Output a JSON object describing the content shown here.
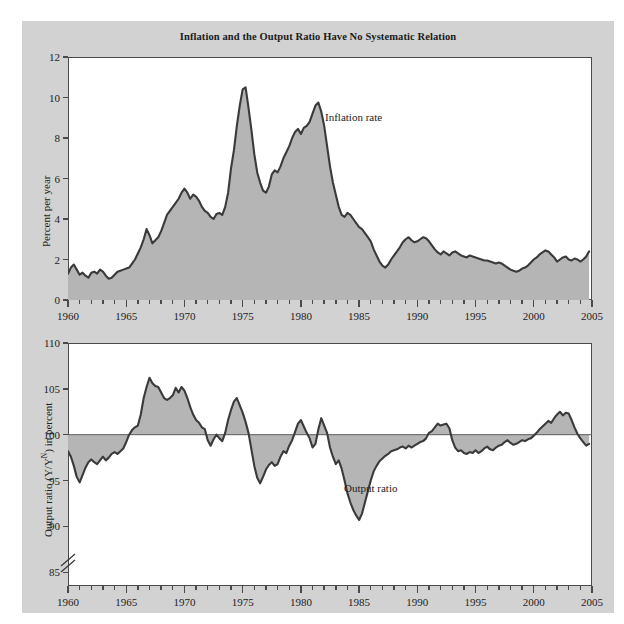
{
  "figure": {
    "title": "Inflation and the Output Ratio Have No Systematic Relation",
    "background_color": "#d2d2d2",
    "plot_background_color": "#ffffff",
    "fill_color": "#b5b5b5",
    "line_color": "#3a3a3a"
  },
  "chart_data": [
    {
      "type": "area",
      "id": "inflation-panel",
      "title": "Inflation and the Output Ratio Have No Systematic Relation",
      "xlabel": "",
      "ylabel": "Percent per year",
      "series_label": "Inflation rate",
      "xlim": [
        1960,
        2005
      ],
      "ylim": [
        0,
        12
      ],
      "xticks": [
        1960,
        1965,
        1970,
        1975,
        1980,
        1985,
        1990,
        1995,
        2000,
        2005
      ],
      "yticks": [
        0,
        2,
        4,
        6,
        8,
        10,
        12
      ],
      "minor_x_step": 1,
      "grid": false,
      "legend_position": "inline-annotation",
      "baseline": 0,
      "x": [
        1960.0,
        1960.25,
        1960.5,
        1960.75,
        1961.0,
        1961.25,
        1961.5,
        1961.75,
        1962.0,
        1962.25,
        1962.5,
        1962.75,
        1963.0,
        1963.25,
        1963.5,
        1963.75,
        1964.0,
        1964.25,
        1964.5,
        1964.75,
        1965.0,
        1965.25,
        1965.5,
        1965.75,
        1966.0,
        1966.25,
        1966.5,
        1966.75,
        1967.0,
        1967.25,
        1967.5,
        1967.75,
        1968.0,
        1968.25,
        1968.5,
        1968.75,
        1969.0,
        1969.25,
        1969.5,
        1969.75,
        1970.0,
        1970.25,
        1970.5,
        1970.75,
        1971.0,
        1971.25,
        1971.5,
        1971.75,
        1972.0,
        1972.25,
        1972.5,
        1972.75,
        1973.0,
        1973.25,
        1973.5,
        1973.75,
        1974.0,
        1974.25,
        1974.5,
        1974.75,
        1975.0,
        1975.25,
        1975.5,
        1975.75,
        1976.0,
        1976.25,
        1976.5,
        1976.75,
        1977.0,
        1977.25,
        1977.5,
        1977.75,
        1978.0,
        1978.25,
        1978.5,
        1978.75,
        1979.0,
        1979.25,
        1979.5,
        1979.75,
        1980.0,
        1980.25,
        1980.5,
        1980.75,
        1981.0,
        1981.25,
        1981.5,
        1981.75,
        1982.0,
        1982.25,
        1982.5,
        1982.75,
        1983.0,
        1983.25,
        1983.5,
        1983.75,
        1984.0,
        1984.25,
        1984.5,
        1984.75,
        1985.0,
        1985.25,
        1985.5,
        1985.75,
        1986.0,
        1986.25,
        1986.5,
        1986.75,
        1987.0,
        1987.25,
        1987.5,
        1987.75,
        1988.0,
        1988.25,
        1988.5,
        1988.75,
        1989.0,
        1989.25,
        1989.5,
        1989.75,
        1990.0,
        1990.25,
        1990.5,
        1990.75,
        1991.0,
        1991.25,
        1991.5,
        1991.75,
        1992.0,
        1992.25,
        1992.5,
        1992.75,
        1993.0,
        1993.25,
        1993.5,
        1993.75,
        1994.0,
        1994.25,
        1994.5,
        1994.75,
        1995.0,
        1995.25,
        1995.5,
        1995.75,
        1996.0,
        1996.25,
        1996.5,
        1996.75,
        1997.0,
        1997.25,
        1997.5,
        1997.75,
        1998.0,
        1998.25,
        1998.5,
        1998.75,
        1999.0,
        1999.25,
        1999.5,
        1999.75,
        2000.0,
        2000.25,
        2000.5,
        2000.75,
        2001.0,
        2001.25,
        2001.5,
        2001.75,
        2002.0,
        2002.25,
        2002.5,
        2002.75,
        2003.0,
        2003.25,
        2003.5,
        2003.75,
        2004.0,
        2004.25,
        2004.5,
        2004.75
      ],
      "values": [
        1.3,
        1.6,
        1.75,
        1.5,
        1.25,
        1.35,
        1.2,
        1.1,
        1.35,
        1.4,
        1.3,
        1.5,
        1.4,
        1.2,
        1.05,
        1.1,
        1.25,
        1.4,
        1.45,
        1.5,
        1.55,
        1.6,
        1.8,
        2.0,
        2.3,
        2.6,
        3.0,
        3.5,
        3.2,
        2.8,
        2.95,
        3.1,
        3.4,
        3.8,
        4.2,
        4.4,
        4.6,
        4.8,
        5.0,
        5.3,
        5.5,
        5.3,
        5.0,
        5.2,
        5.1,
        4.9,
        4.6,
        4.4,
        4.3,
        4.1,
        4.0,
        4.25,
        4.3,
        4.2,
        4.6,
        5.3,
        6.5,
        7.4,
        8.6,
        9.6,
        10.4,
        10.5,
        9.5,
        8.4,
        7.2,
        6.3,
        5.8,
        5.4,
        5.3,
        5.6,
        6.2,
        6.4,
        6.3,
        6.6,
        7.0,
        7.3,
        7.6,
        8.0,
        8.3,
        8.45,
        8.2,
        8.5,
        8.6,
        8.8,
        9.2,
        9.6,
        9.75,
        9.3,
        8.6,
        7.6,
        6.6,
        5.8,
        5.2,
        4.6,
        4.2,
        4.1,
        4.3,
        4.2,
        4.0,
        3.8,
        3.6,
        3.5,
        3.3,
        3.1,
        2.9,
        2.5,
        2.2,
        1.9,
        1.7,
        1.6,
        1.75,
        2.0,
        2.2,
        2.4,
        2.6,
        2.85,
        3.0,
        3.1,
        2.95,
        2.85,
        2.9,
        3.0,
        3.1,
        3.05,
        2.9,
        2.7,
        2.5,
        2.35,
        2.25,
        2.4,
        2.3,
        2.2,
        2.35,
        2.4,
        2.3,
        2.2,
        2.15,
        2.1,
        2.2,
        2.15,
        2.1,
        2.05,
        2.0,
        1.95,
        1.95,
        1.9,
        1.85,
        1.8,
        1.85,
        1.8,
        1.7,
        1.6,
        1.5,
        1.45,
        1.4,
        1.45,
        1.55,
        1.6,
        1.7,
        1.85,
        2.0,
        2.1,
        2.25,
        2.35,
        2.45,
        2.4,
        2.25,
        2.1,
        1.9,
        2.0,
        2.1,
        2.15,
        2.0,
        1.95,
        2.05,
        2.0,
        1.9,
        2.0,
        2.15,
        2.4
      ]
    },
    {
      "type": "area",
      "id": "output-ratio-panel",
      "title": "",
      "xlabel": "",
      "ylabel": "Output ratio (Y/Y^N) in percent",
      "series_label": "Output ratio",
      "xlim": [
        1960,
        2005
      ],
      "ylim": [
        83.5,
        110
      ],
      "xticks": [
        1960,
        1965,
        1970,
        1975,
        1980,
        1985,
        1990,
        1995,
        2000,
        2005
      ],
      "yticks": [
        85,
        90,
        95,
        100,
        105,
        110
      ],
      "minor_x_step": 1,
      "grid": false,
      "axis_break": true,
      "legend_position": "inline-annotation",
      "baseline": 100,
      "x": [
        1960.0,
        1960.25,
        1960.5,
        1960.75,
        1961.0,
        1961.25,
        1961.5,
        1961.75,
        1962.0,
        1962.25,
        1962.5,
        1962.75,
        1963.0,
        1963.25,
        1963.5,
        1963.75,
        1964.0,
        1964.25,
        1964.5,
        1964.75,
        1965.0,
        1965.25,
        1965.5,
        1965.75,
        1966.0,
        1966.25,
        1966.5,
        1966.75,
        1967.0,
        1967.25,
        1967.5,
        1967.75,
        1968.0,
        1968.25,
        1968.5,
        1968.75,
        1969.0,
        1969.25,
        1969.5,
        1969.75,
        1970.0,
        1970.25,
        1970.5,
        1970.75,
        1971.0,
        1971.25,
        1971.5,
        1971.75,
        1972.0,
        1972.25,
        1972.5,
        1972.75,
        1973.0,
        1973.25,
        1973.5,
        1973.75,
        1974.0,
        1974.25,
        1974.5,
        1974.75,
        1975.0,
        1975.25,
        1975.5,
        1975.75,
        1976.0,
        1976.25,
        1976.5,
        1976.75,
        1977.0,
        1977.25,
        1977.5,
        1977.75,
        1978.0,
        1978.25,
        1978.5,
        1978.75,
        1979.0,
        1979.25,
        1979.5,
        1979.75,
        1980.0,
        1980.25,
        1980.5,
        1980.75,
        1981.0,
        1981.25,
        1981.5,
        1981.75,
        1982.0,
        1982.25,
        1982.5,
        1982.75,
        1983.0,
        1983.25,
        1983.5,
        1983.75,
        1984.0,
        1984.25,
        1984.5,
        1984.75,
        1985.0,
        1985.25,
        1985.5,
        1985.75,
        1986.0,
        1986.25,
        1986.5,
        1986.75,
        1987.0,
        1987.25,
        1987.5,
        1987.75,
        1988.0,
        1988.25,
        1988.5,
        1988.75,
        1989.0,
        1989.25,
        1989.5,
        1989.75,
        1990.0,
        1990.25,
        1990.5,
        1990.75,
        1991.0,
        1991.25,
        1991.5,
        1991.75,
        1992.0,
        1992.25,
        1992.5,
        1992.75,
        1993.0,
        1993.25,
        1993.5,
        1993.75,
        1994.0,
        1994.25,
        1994.5,
        1994.75,
        1995.0,
        1995.25,
        1995.5,
        1995.75,
        1996.0,
        1996.25,
        1996.5,
        1996.75,
        1997.0,
        1997.25,
        1997.5,
        1997.75,
        1998.0,
        1998.25,
        1998.5,
        1998.75,
        1999.0,
        1999.25,
        1999.5,
        1999.75,
        2000.0,
        2000.25,
        2000.5,
        2000.75,
        2001.0,
        2001.25,
        2001.5,
        2001.75,
        2002.0,
        2002.25,
        2002.5,
        2002.75,
        2003.0,
        2003.25,
        2003.5,
        2003.75,
        2004.0,
        2004.25,
        2004.5,
        2004.75
      ],
      "values": [
        98.2,
        97.6,
        96.6,
        95.4,
        94.8,
        95.6,
        96.4,
        97.0,
        97.3,
        97.0,
        96.8,
        97.2,
        97.6,
        97.2,
        97.5,
        97.9,
        98.1,
        97.9,
        98.2,
        98.5,
        99.2,
        100.0,
        100.5,
        100.8,
        101.0,
        102.2,
        104.0,
        105.2,
        106.2,
        105.6,
        105.3,
        105.2,
        104.6,
        104.0,
        103.8,
        104.0,
        104.3,
        105.1,
        104.6,
        105.2,
        104.8,
        104.0,
        103.0,
        102.2,
        101.6,
        101.3,
        100.8,
        100.6,
        99.4,
        98.8,
        99.5,
        100.0,
        99.6,
        99.3,
        100.2,
        101.6,
        102.7,
        103.6,
        104.0,
        103.2,
        102.4,
        101.4,
        100.2,
        98.4,
        96.6,
        95.3,
        94.7,
        95.4,
        96.2,
        96.7,
        97.0,
        96.6,
        96.8,
        97.6,
        98.2,
        98.0,
        98.8,
        99.4,
        100.3,
        101.2,
        101.6,
        100.9,
        100.2,
        99.6,
        98.6,
        99.0,
        100.6,
        101.8,
        101.0,
        100.2,
        98.6,
        97.6,
        96.8,
        97.2,
        96.3,
        95.0,
        93.6,
        92.6,
        91.8,
        91.2,
        90.7,
        91.4,
        92.6,
        93.8,
        95.0,
        96.0,
        96.6,
        97.1,
        97.4,
        97.7,
        97.9,
        98.2,
        98.3,
        98.4,
        98.6,
        98.7,
        98.5,
        98.8,
        98.6,
        98.8,
        99.0,
        99.2,
        99.3,
        99.6,
        100.2,
        100.4,
        100.8,
        101.2,
        101.0,
        101.1,
        101.2,
        100.7,
        99.4,
        98.6,
        98.2,
        98.3,
        98.0,
        97.9,
        98.1,
        98.0,
        98.3,
        98.0,
        98.2,
        98.5,
        98.7,
        98.4,
        98.3,
        98.6,
        98.8,
        98.9,
        99.2,
        99.4,
        99.1,
        98.9,
        99.0,
        99.2,
        99.4,
        99.3,
        99.5,
        99.6,
        99.9,
        100.2,
        100.6,
        100.9,
        101.2,
        101.5,
        101.3,
        101.8,
        102.2,
        102.5,
        102.1,
        102.4,
        102.3,
        101.6,
        100.8,
        100.1,
        99.6,
        99.2,
        98.8,
        99.0
      ]
    }
  ],
  "panels": {
    "top": {
      "ylabel": "Percent per year",
      "series_label": "Inflation rate",
      "ytick_labels": [
        "0",
        "2",
        "4",
        "6",
        "8",
        "10",
        "12"
      ],
      "xtick_labels": [
        "1960",
        "1965",
        "1970",
        "1975",
        "1980",
        "1985",
        "1990",
        "1995",
        "2000",
        "2005"
      ]
    },
    "bottom": {
      "ylabel_parts": {
        "pre": "Output ratio (Y/Y",
        "sup": "N",
        "post": ") in percent"
      },
      "series_label": "Output ratio",
      "ytick_labels": [
        "85",
        "90",
        "95",
        "100",
        "105",
        "110"
      ],
      "xtick_labels": [
        "1960",
        "1965",
        "1970",
        "1975",
        "1980",
        "1985",
        "1990",
        "1995",
        "2000",
        "2005"
      ]
    }
  }
}
